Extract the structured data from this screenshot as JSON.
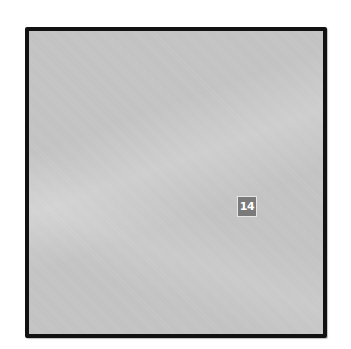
{
  "panel": {
    "background_color": "#c5c5c5",
    "border_color": "#111111"
  },
  "badge": {
    "label": "14",
    "background_color": "#7a7a7a",
    "text_color": "#ffffff"
  }
}
